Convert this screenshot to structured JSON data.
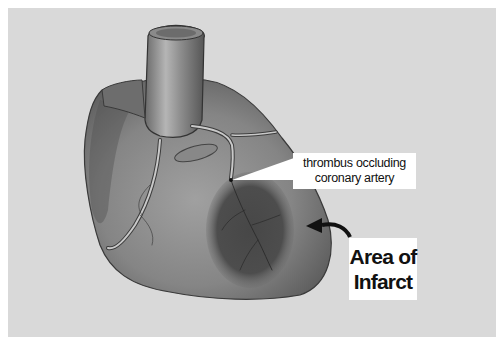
{
  "figure": {
    "background_color": "#d9d9d9",
    "border_color": "#ffffff"
  },
  "labels": {
    "thrombus": {
      "line1": "thrombus occluding",
      "line2": "coronary artery"
    },
    "infarct": {
      "line1": "Area of",
      "line2": "Infarct"
    }
  },
  "colors": {
    "heart_fill": "#7a7a7a",
    "heart_light": "#a6a6a6",
    "infarct_fill": "#4a4a4a",
    "artery": "#c8c8c8",
    "arrow": "#111111"
  }
}
